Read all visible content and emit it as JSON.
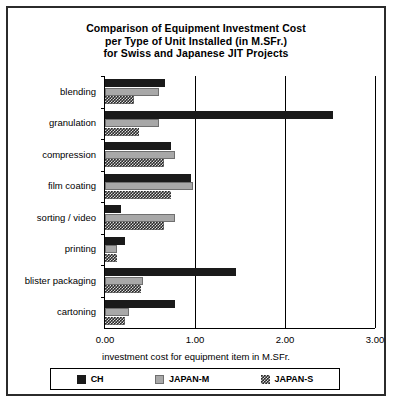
{
  "chart_data": {
    "type": "bar",
    "orientation": "horizontal",
    "title": "Comparison of Equipment Investment Cost per Type of Unit Installed (in M.SFr.) for Swiss and Japanese JIT Projects",
    "title_lines": [
      "Comparison of Equipment Investment Cost",
      "per Type of Unit Installed (in M.SFr.)",
      "for Swiss and Japanese JIT Projects"
    ],
    "xlabel": "investment cost for equipment item in M.SFr.",
    "ylabel": "",
    "xlim": [
      0.0,
      3.0
    ],
    "xticks": [
      "0.00",
      "1.00",
      "2.00",
      "3.00"
    ],
    "xtick_values": [
      0.0,
      1.0,
      2.0,
      3.0
    ],
    "grid": true,
    "legend_position": "bottom",
    "categories": [
      "blending",
      "granulation",
      "compression",
      "film  coating",
      "sorting  /  video",
      "printing",
      "blister  packaging",
      "cartoning"
    ],
    "series": [
      {
        "name": "CH",
        "color": "#1a1a1a",
        "pattern": "solid-black",
        "values": [
          0.67,
          2.53,
          0.73,
          0.95,
          0.18,
          0.22,
          1.45,
          0.78
        ]
      },
      {
        "name": "JAPAN-M",
        "color": "#a8a8a8",
        "pattern": "solid-gray",
        "values": [
          0.6,
          0.6,
          0.78,
          0.98,
          0.78,
          0.13,
          0.42,
          0.27
        ]
      },
      {
        "name": "JAPAN-S",
        "color": "#2a2a2a",
        "pattern": "checkered",
        "values": [
          0.32,
          0.38,
          0.65,
          0.73,
          0.66,
          0.13,
          0.4,
          0.22
        ]
      }
    ]
  },
  "legend": {
    "entries": [
      {
        "label": "CH",
        "swatch": "ch"
      },
      {
        "label": "JAPAN-M",
        "swatch": "jm"
      },
      {
        "label": "JAPAN-S",
        "swatch": "js"
      }
    ]
  }
}
